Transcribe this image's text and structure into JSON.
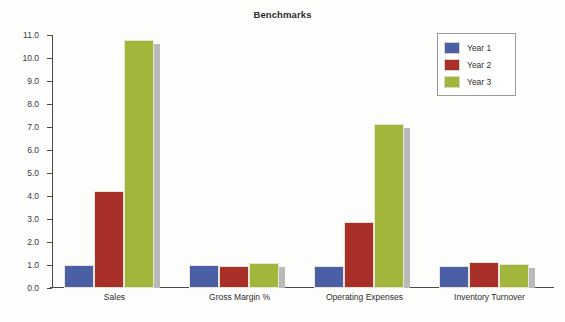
{
  "chart_data": {
    "type": "bar",
    "title": "Benchmarks",
    "xlabel": "",
    "ylabel": "",
    "ylim": [
      0.0,
      11.0
    ],
    "ytick_step": 1.0,
    "yticks": [
      "0.0",
      "1.0",
      "2.0",
      "3.0",
      "4.0",
      "5.0",
      "6.0",
      "7.0",
      "8.0",
      "9.0",
      "10.0",
      "11.0"
    ],
    "grid": false,
    "legend_position": "top-right",
    "categories": [
      "Sales",
      "Gross Margin %",
      "Operating Expenses",
      "Inventory Turnover"
    ],
    "series": [
      {
        "name": "Year 1",
        "color": "#4a5fa5",
        "values": [
          1.0,
          0.98,
          0.97,
          0.95
        ]
      },
      {
        "name": "Year 2",
        "color": "#a83028",
        "values": [
          4.2,
          0.97,
          2.87,
          1.12
        ]
      },
      {
        "name": "Year 3",
        "color": "#a3b63c",
        "values": [
          10.8,
          1.1,
          7.12,
          1.04
        ]
      }
    ]
  },
  "legend": {
    "entries": [
      {
        "label": "Year 1",
        "color": "#4a5fa5"
      },
      {
        "label": "Year 2",
        "color": "#a83028"
      },
      {
        "label": "Year 3",
        "color": "#a3b63c"
      }
    ]
  },
  "colors": {
    "year1": "#4a5fa5",
    "year2": "#a83028",
    "year3": "#a3b63c",
    "shadow": "#b9b9b9",
    "axis": "#4a4a4a",
    "background": "#fdfdfc",
    "text": "#2e2e2e"
  }
}
